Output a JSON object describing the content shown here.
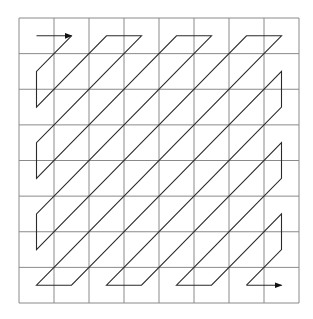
{
  "diagram": {
    "type": "zigzag-scan",
    "grid": {
      "rows": 8,
      "cols": 8,
      "left": 19,
      "top": 18,
      "right": 299,
      "bottom": 303
    },
    "colors": {
      "grid": "#8a8a8a",
      "path": "#2a2a2a",
      "background": "#ffffff"
    },
    "start_arrow": {
      "from": [
        0,
        0
      ],
      "to": [
        0,
        1
      ]
    },
    "end_arrow": {
      "from": [
        7,
        6
      ],
      "to": [
        7,
        7
      ]
    },
    "scan_order": "zigzag"
  }
}
